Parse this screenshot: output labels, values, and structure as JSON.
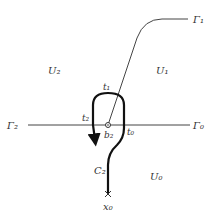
{
  "diagram": {
    "labels": {
      "gamma1": "Γ₁",
      "gamma2": "Γ₂",
      "gamma0": "Γ₀",
      "u2": "U₂",
      "u1": "U₁",
      "u0": "U₀",
      "t1": "t₁",
      "t2": "t₂",
      "t0": "t₀",
      "b2": "b₂",
      "c2": "C₂",
      "x0": "x₀"
    },
    "colors": {
      "line": "#333333",
      "thick_path": "#111111",
      "background": "#ffffff"
    }
  }
}
